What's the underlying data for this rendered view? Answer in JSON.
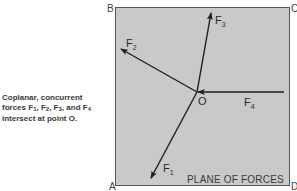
{
  "caption": {
    "line1": "Coplanar, concurrent",
    "line2_prefix": "forces F",
    "line2_parts": [
      {
        "base": "F",
        "sub": "1"
      },
      {
        "base": "F",
        "sub": "2"
      },
      {
        "base": "F",
        "sub": "3"
      },
      {
        "base": "F",
        "sub": "4"
      }
    ],
    "line2_text": "forces F₁, F₂, F₃, and F₄",
    "line3": "intersect at point O."
  },
  "plane": {
    "label": "PLANE OF FORCES",
    "fill_color": "#c9c9c9",
    "border_color": "#555555",
    "corners": {
      "top_left": "B",
      "top_right": "C",
      "bottom_left": "A",
      "bottom_right": "D"
    }
  },
  "origin": {
    "label": "O"
  },
  "forces": [
    {
      "id": "F1",
      "base": "F",
      "sub": "1",
      "direction": "down-left"
    },
    {
      "id": "F2",
      "base": "F",
      "sub": "2",
      "direction": "up-left"
    },
    {
      "id": "F3",
      "base": "F",
      "sub": "3",
      "direction": "up"
    },
    {
      "id": "F4",
      "base": "F",
      "sub": "4",
      "direction": "left (toward O)"
    }
  ],
  "colors": {
    "line": "#1e1e1e",
    "text": "#3a3a3a"
  }
}
